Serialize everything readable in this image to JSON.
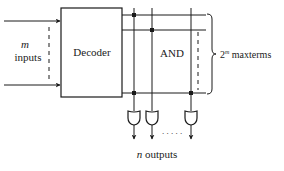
{
  "diagram": {
    "inputs_label_var": "m",
    "inputs_label_text": "inputs",
    "decoder_label": "Decoder",
    "and_label": "AND",
    "maxterms_base": "2",
    "maxterms_exp": "m",
    "maxterms_text": " maxterms",
    "outputs_var": "n",
    "outputs_text": " outputs",
    "dots": ". . . . .",
    "colors": {
      "stroke": "#1a1a1a",
      "background": "#ffffff"
    }
  }
}
